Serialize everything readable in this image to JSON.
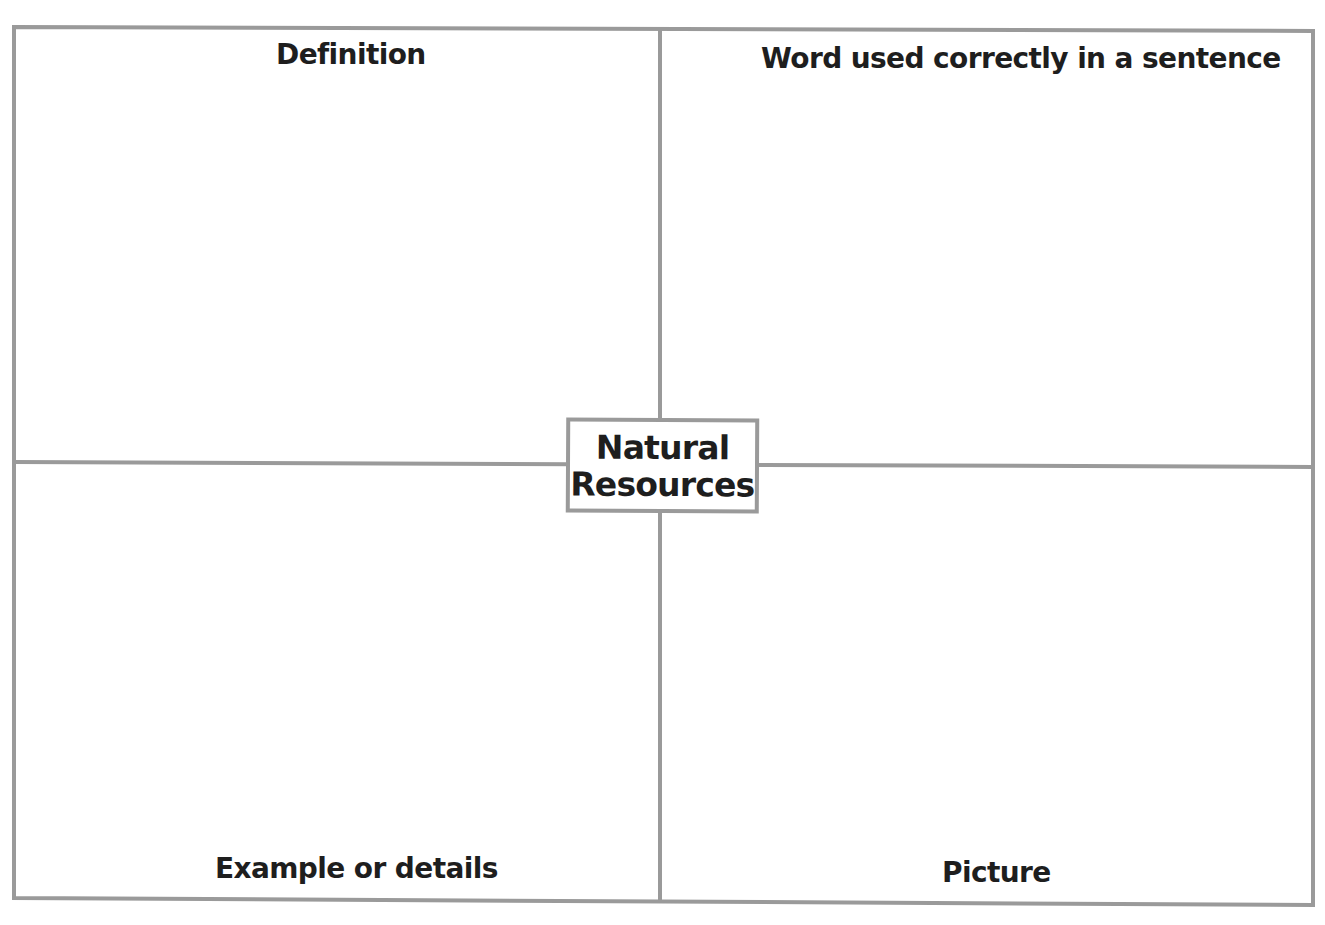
{
  "organizer": {
    "type": "four-square vocabulary graphic organizer",
    "center_term": {
      "line1": "Natural",
      "line2": "Resources"
    },
    "quadrants": {
      "top_left": {
        "label": "Definition"
      },
      "top_right": {
        "label": "Word used correctly in a sentence"
      },
      "bottom_left": {
        "label": "Example or details"
      },
      "bottom_right": {
        "label": "Picture"
      }
    }
  },
  "colors": {
    "line": "#9a9a9a",
    "text": "#1e1e1e",
    "background": "#ffffff"
  }
}
